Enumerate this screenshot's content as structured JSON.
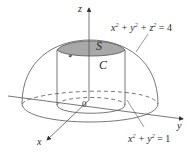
{
  "figure": {
    "labels": {
      "z_axis": "z",
      "x_axis": "x",
      "y_axis": "y",
      "origin": "0",
      "surface": "S",
      "curve": "C",
      "sphere_eq": {
        "base": "x",
        "sup1": "2",
        "plus1": " + y",
        "sup2": "2",
        "plus2": " + z",
        "sup3": "2",
        "rhs": " = 4"
      },
      "cylinder_eq": {
        "base": "x",
        "sup1": "2",
        "plus1": " + y",
        "sup2": "2",
        "rhs": " = 1"
      }
    },
    "colors": {
      "line": "#555555",
      "cap_fill": "#a8a8a8",
      "text": "#2a2a2a"
    }
  }
}
